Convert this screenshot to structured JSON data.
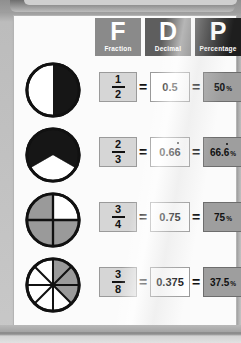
{
  "headers": [
    {
      "letter": "F",
      "label": "Fraction",
      "color": "#8a8a8a"
    },
    {
      "letter": "D",
      "label": "Decimal",
      "color": "#5e5e5e"
    },
    {
      "letter": "P",
      "label": "Percentage",
      "color": "#1e1e1e"
    }
  ],
  "equals_symbol": "=",
  "percent_symbol": "%",
  "rows": [
    {
      "numerator": "1",
      "denominator": "2",
      "decimal_whole": "0.5",
      "decimal_prefix": "0.5",
      "decimal_recurring": "",
      "percent_prefix": "50",
      "percent_recurring": "",
      "shaded_parts": 1,
      "total_parts": 2,
      "diagram_name": "half-circle-diagram"
    },
    {
      "numerator": "2",
      "denominator": "3",
      "decimal_whole": "0.66",
      "decimal_prefix": "0.6",
      "decimal_recurring": "6",
      "percent_prefix": "66.",
      "percent_recurring": "6",
      "shaded_parts": 2,
      "total_parts": 3,
      "diagram_name": "two-thirds-circle-diagram"
    },
    {
      "numerator": "3",
      "denominator": "4",
      "decimal_whole": "0.75",
      "decimal_prefix": "0.75",
      "decimal_recurring": "",
      "percent_prefix": "75",
      "percent_recurring": "",
      "shaded_parts": 3,
      "total_parts": 4,
      "diagram_name": "three-quarters-circle-diagram"
    },
    {
      "numerator": "3",
      "denominator": "8",
      "decimal_whole": "0.375",
      "decimal_prefix": "0.375",
      "decimal_recurring": "",
      "percent_prefix": "37.5",
      "percent_recurring": "",
      "shaded_parts": 3,
      "total_parts": 8,
      "diagram_name": "three-eighths-circle-diagram"
    }
  ],
  "colors": {
    "shade_dark": "#161616",
    "shade_gray": "#9a9a9a",
    "unshaded": "#ffffff",
    "stroke": "#111111",
    "sheet": "#fbfbfb"
  }
}
